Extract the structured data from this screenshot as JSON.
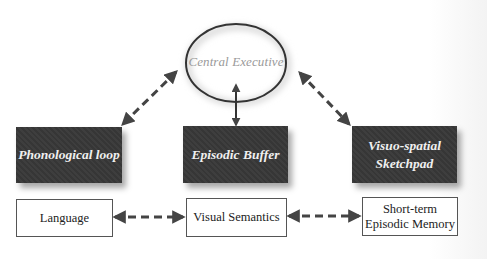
{
  "diagram": {
    "central": {
      "label": "Central Executive",
      "shape": "ellipse"
    },
    "components": [
      {
        "id": "phonological",
        "label": "Phonological loop"
      },
      {
        "id": "episodic",
        "label": "Episodic Buffer"
      },
      {
        "id": "visuospatial",
        "label_line1": "Visuo-spatial",
        "label_line2": "Sketchpad"
      }
    ],
    "outputs": [
      {
        "id": "language",
        "label": "Language"
      },
      {
        "id": "visual-semantics",
        "label": "Visual Semantics"
      },
      {
        "id": "short-term",
        "label_line1": "Short-term",
        "label_line2": "Episodic Memory"
      }
    ],
    "connections": [
      {
        "from": "Central Executive",
        "to": "Phonological loop",
        "style": "dashed",
        "direction": "bidirectional"
      },
      {
        "from": "Central Executive",
        "to": "Episodic Buffer",
        "style": "solid",
        "direction": "bidirectional"
      },
      {
        "from": "Central Executive",
        "to": "Visuo-spatial Sketchpad",
        "style": "dashed",
        "direction": "bidirectional"
      },
      {
        "from": "Language",
        "to": "Visual Semantics",
        "style": "dashed",
        "direction": "bidirectional"
      },
      {
        "from": "Visual Semantics",
        "to": "Short-term Episodic Memory",
        "style": "dashed",
        "direction": "bidirectional"
      }
    ],
    "colors": {
      "dark_box": "#3a3a3a",
      "dark_box_text": "#f0f0f0",
      "ellipse_text": "#9a9a9a",
      "arrow": "#444444",
      "outline": "#555555"
    }
  }
}
